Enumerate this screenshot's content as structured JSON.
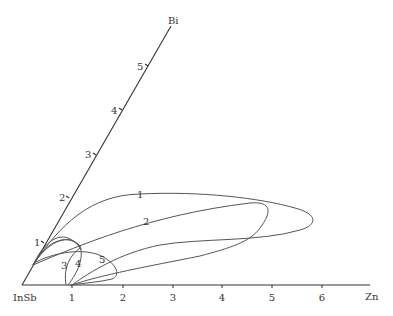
{
  "diagram": {
    "type": "ternary-corner phase diagram",
    "origin_label": "InSb",
    "x_axis": {
      "label": "Zn",
      "ticks": [
        "1",
        "2",
        "3",
        "4",
        "5",
        "6"
      ]
    },
    "y_axis": {
      "label": "Bi",
      "ticks": [
        "1",
        "2",
        "3",
        "4",
        "5"
      ]
    },
    "curves": [
      {
        "label": "1"
      },
      {
        "label": "2"
      },
      {
        "label": "3"
      },
      {
        "label": "4"
      },
      {
        "label": "5"
      }
    ],
    "colors": {
      "axis": "#333333",
      "curve": "#555555"
    }
  }
}
